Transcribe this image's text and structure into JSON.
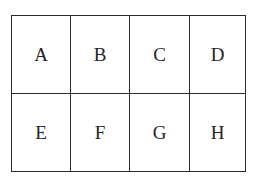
{
  "diagram": {
    "type": "grid",
    "rows": 2,
    "columns": 4,
    "cells": [
      [
        "A",
        "B",
        "C",
        "D"
      ],
      [
        "E",
        "F",
        "G",
        "H"
      ]
    ]
  }
}
